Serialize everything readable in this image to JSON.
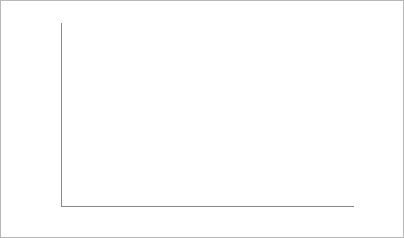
{
  "chart_data": {
    "type": "area",
    "xlabel": "",
    "ylabel": "Billion passenger-miles",
    "xlim": [
      1940,
      1996
    ],
    "ylim": [
      0,
      2500
    ],
    "ytick_labels": [
      "0",
      "500",
      "1,000",
      "1,500",
      "2,000",
      "2,500"
    ],
    "ytick_values": [
      0,
      500,
      1000,
      1500,
      2000,
      2500
    ],
    "xtick_labels": [
      "1940",
      "1950",
      "1960",
      "1970",
      "1980",
      "1990",
      "1996"
    ],
    "xtick_values": [
      1940,
      1950,
      1960,
      1970,
      1980,
      1990,
      1996
    ],
    "grid": "horizontal",
    "legend_position": "right",
    "stacked": true,
    "stack_order": [
      "Car",
      "Air",
      "Bus",
      "Train"
    ],
    "x": [
      1940,
      1941,
      1942,
      1943,
      1944,
      1945,
      1946,
      1947,
      1948,
      1949,
      1950,
      1951,
      1952,
      1953,
      1954,
      1955,
      1956,
      1957,
      1958,
      1959,
      1960,
      1961,
      1962,
      1963,
      1964,
      1965,
      1966,
      1967,
      1968,
      1969,
      1970,
      1971,
      1972,
      1973,
      1974,
      1975,
      1976,
      1977,
      1978,
      1979,
      1980,
      1981,
      1982,
      1983,
      1984,
      1985,
      1986,
      1987,
      1988,
      1989,
      1990,
      1991,
      1992,
      1993,
      1994,
      1995,
      1996
    ],
    "series": [
      {
        "name": "Car",
        "color": "#ffffff",
        "pattern": "vertical-hatch",
        "values": [
          260,
          275,
          235,
          205,
          215,
          250,
          330,
          350,
          370,
          400,
          440,
          455,
          470,
          500,
          520,
          565,
          585,
          600,
          615,
          650,
          665,
          680,
          715,
          750,
          790,
          825,
          860,
          890,
          935,
          975,
          1005,
          1055,
          1110,
          1130,
          1100,
          1140,
          1190,
          1215,
          1255,
          1230,
          1210,
          1215,
          1240,
          1290,
          1330,
          1380,
          1425,
          1465,
          1520,
          1560,
          1590,
          1595,
          1650,
          1685,
          1730,
          1765,
          1790
        ]
      },
      {
        "name": "Air",
        "color": "#f0f0f0",
        "pattern": "solid",
        "values": [
          1,
          1,
          1,
          1,
          2,
          4,
          6,
          6,
          6,
          7,
          10,
          13,
          15,
          18,
          21,
          25,
          28,
          32,
          32,
          37,
          39,
          42,
          46,
          52,
          62,
          72,
          85,
          103,
          120,
          134,
          142,
          143,
          160,
          172,
          172,
          169,
          186,
          198,
          222,
          250,
          249,
          243,
          251,
          274,
          299,
          314,
          337,
          354,
          371,
          388,
          404,
          400,
          423,
          436,
          463,
          486,
          505
        ]
      },
      {
        "name": "Bus",
        "color": "#555555",
        "pattern": "solid",
        "values": [
          19,
          22,
          38,
          54,
          62,
          67,
          50,
          42,
          38,
          33,
          31,
          32,
          32,
          31,
          29,
          27,
          26,
          25,
          24,
          23,
          22,
          22,
          23,
          23,
          24,
          24,
          25,
          25,
          25,
          25,
          25,
          25,
          26,
          27,
          28,
          26,
          26,
          26,
          26,
          28,
          27,
          26,
          25,
          24,
          24,
          24,
          23,
          23,
          23,
          23,
          23,
          23,
          22,
          21,
          21,
          21,
          21
        ]
      },
      {
        "name": "Train",
        "color": "#111111",
        "pattern": "solid",
        "values": [
          24,
          30,
          54,
          88,
          96,
          92,
          66,
          46,
          41,
          36,
          32,
          35,
          34,
          32,
          29,
          29,
          28,
          26,
          23,
          22,
          22,
          20,
          20,
          19,
          18,
          18,
          17,
          15,
          13,
          12,
          11,
          9,
          9,
          9,
          10,
          10,
          10,
          10,
          10,
          11,
          11,
          11,
          11,
          11,
          11,
          11,
          11,
          11,
          11,
          11,
          11,
          13,
          15,
          14,
          13,
          13,
          13
        ]
      }
    ],
    "legend": [
      {
        "label": "Train",
        "color": "#111111",
        "pattern": "solid"
      },
      {
        "label": "Bus",
        "color": "#555555",
        "pattern": "solid"
      },
      {
        "label": "Air",
        "color": "#f0f0f0",
        "pattern": "solid"
      },
      {
        "label": "Car",
        "color": "#ffffff",
        "pattern": "vertical-hatch"
      }
    ]
  }
}
